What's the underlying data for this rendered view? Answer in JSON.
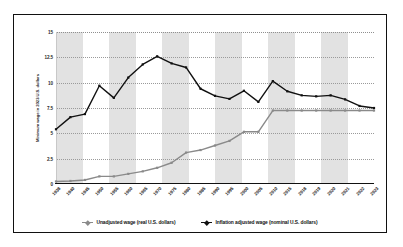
{
  "chart_data": {
    "type": "line",
    "title": "",
    "xlabel": "",
    "ylabel": "Minimum wage in 2023 U.S. dollars",
    "ylim": [
      0,
      15
    ],
    "yticks": [
      "0",
      "2.5",
      "5",
      "7.5",
      "10",
      "12.5",
      "15"
    ],
    "grid": true,
    "legend_position": "bottom",
    "categories": [
      "1938",
      "1940",
      "1945",
      "1950",
      "1955",
      "1960",
      "1965",
      "1970",
      "1975",
      "1980",
      "1985",
      "1990",
      "1995",
      "2000",
      "2005",
      "2010",
      "2015",
      "2018",
      "2019",
      "2020",
      "2021",
      "2022",
      "2023"
    ],
    "series": [
      {
        "name": "Unadjusted wage (real U.S. dollars)",
        "color": "#8a8a8a",
        "values": [
          0.25,
          0.3,
          0.4,
          0.75,
          0.75,
          1.0,
          1.25,
          1.6,
          2.1,
          3.1,
          3.35,
          3.8,
          4.25,
          5.15,
          5.15,
          7.25,
          7.25,
          7.25,
          7.25,
          7.25,
          7.25,
          7.25,
          7.25
        ]
      },
      {
        "name": "Inflation adjusted wage (nominal U.S. dollars)",
        "color": "#111111",
        "values": [
          5.4,
          6.6,
          6.9,
          9.7,
          8.5,
          10.5,
          11.8,
          12.6,
          11.9,
          11.5,
          9.4,
          8.7,
          8.4,
          9.2,
          8.1,
          10.15,
          9.15,
          8.75,
          8.65,
          8.75,
          8.35,
          7.7,
          7.5
        ]
      }
    ]
  },
  "legend": {
    "items": [
      {
        "label": "Unadjusted wage (real U.S. dollars)",
        "color": "#8a8a8a"
      },
      {
        "label": "Inflation adjusted wage (nominal U.S. dollars)",
        "color": "#111111"
      }
    ]
  }
}
